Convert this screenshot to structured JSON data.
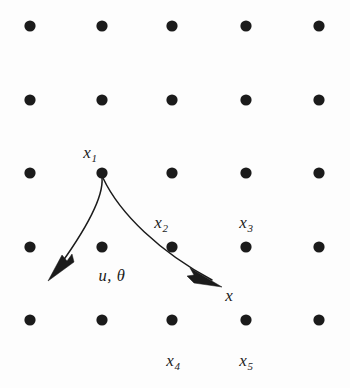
{
  "figure": {
    "background_color": "#fdfdfd",
    "ink_color": "#1b1b1b",
    "width": 350,
    "height": 388
  },
  "lattice": {
    "rows": 5,
    "cols": 5,
    "dot_radius": 5.6,
    "col_x": [
      30,
      102,
      172,
      246,
      319
    ],
    "row_y": [
      26,
      100,
      173,
      247,
      320
    ]
  },
  "labels": [
    {
      "id": "x1",
      "text": "x",
      "sub": "1",
      "x": 90,
      "y": 152
    },
    {
      "id": "x2",
      "text": "x",
      "sub": "2",
      "x": 161,
      "y": 222
    },
    {
      "id": "x3",
      "text": "x",
      "sub": "3",
      "x": 246,
      "y": 222
    },
    {
      "id": "x4",
      "text": "x",
      "sub": "4",
      "x": 173,
      "y": 360
    },
    {
      "id": "x5",
      "text": "x",
      "sub": "5",
      "x": 246,
      "y": 360
    },
    {
      "id": "x-terminal",
      "text": "x",
      "sub": "",
      "x": 229,
      "y": 295
    },
    {
      "id": "u-theta",
      "text": "u, θ",
      "sub": "",
      "x": 112,
      "y": 276
    }
  ],
  "curves": [
    {
      "id": "left-branch",
      "from": "x1",
      "path": "M 102 178 C 104 200 80 238 55 272",
      "arrow_tip": [
        48,
        281
      ],
      "arrow_polygon": "48,281 74,262 72,254 67,261 62,255"
    },
    {
      "id": "right-branch",
      "from": "x1",
      "to": "x-terminal",
      "path": "M 103 178 C 120 214 160 252 212 280",
      "arrow_tip": [
        222,
        287
      ],
      "arrow_polygon": "222,287 190,268 194,275 187,276 194,283"
    }
  ]
}
